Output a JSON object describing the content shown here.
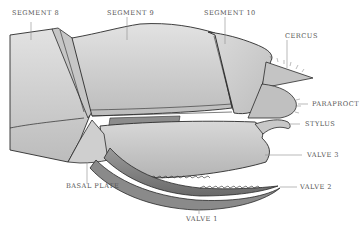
{
  "diagram": {
    "colors": {
      "background": "#ffffff",
      "outline": "#2a2a2a",
      "light_fill": "#d6d6d6",
      "mid_fill": "#bdbdbd",
      "dark_fill": "#7a7a7a",
      "label_text": "#555555",
      "leader_line": "#8a8a8a"
    },
    "labels": [
      {
        "id": "segment-8",
        "text": "SEGMENT 8"
      },
      {
        "id": "segment-9",
        "text": "SEGMENT 9"
      },
      {
        "id": "segment-10",
        "text": "SEGMENT 10"
      },
      {
        "id": "cercus",
        "text": "CERCUS"
      },
      {
        "id": "paraproct",
        "text": "PARAPROCT"
      },
      {
        "id": "stylus",
        "text": "STYLUS"
      },
      {
        "id": "valve-3",
        "text": "VALVE 3"
      },
      {
        "id": "valve-2",
        "text": "VALVE 2"
      },
      {
        "id": "basal-plate",
        "text": "BASAL PLATE"
      },
      {
        "id": "valve-1",
        "text": "VALVE 1"
      }
    ]
  }
}
